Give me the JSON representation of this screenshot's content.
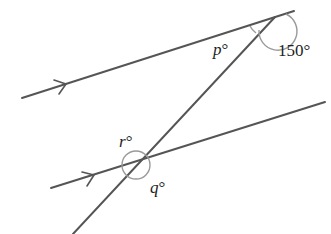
{
  "diagram": {
    "colors": {
      "line": "#555555",
      "arc": "#9a9a9a",
      "text": "#222222",
      "background": "#ffffff"
    },
    "labels": {
      "p": "p",
      "q": "q",
      "r": "r",
      "angle_150": "150°",
      "degree": "°"
    },
    "elements": {
      "top_parallel_line": {
        "x1": 22,
        "y1": 98,
        "x2": 294,
        "y2": 11
      },
      "bottom_parallel_line": {
        "x1": 51,
        "y1": 188,
        "x2": 325,
        "y2": 102
      },
      "transversal": {
        "x1": 73,
        "y1": 234,
        "x2": 275,
        "y2": 17
      }
    }
  }
}
